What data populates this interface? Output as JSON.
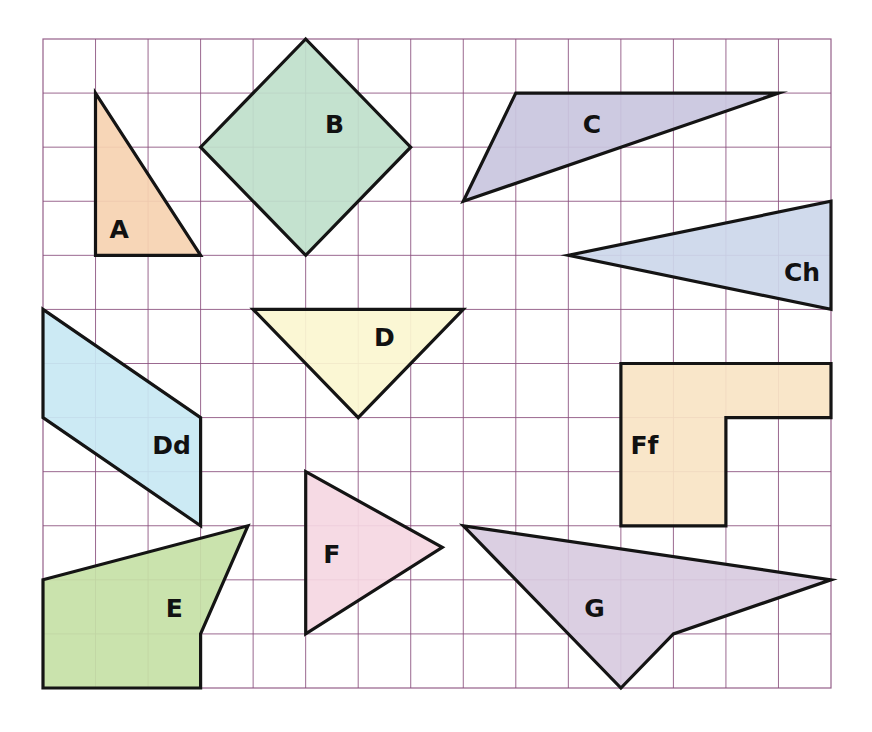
{
  "figure": {
    "width": 872,
    "height": 732,
    "grid": {
      "left": 43,
      "top": 39,
      "right": 831,
      "bottom": 688,
      "columns": 15,
      "rows": 12,
      "line_color": "#8a4f7d"
    },
    "outline_color": "#141414",
    "shapes": [
      {
        "id": "A",
        "label": "A",
        "fill": "#f6d2b1",
        "points": [
          [
            1,
            1
          ],
          [
            1,
            4
          ],
          [
            3,
            4
          ]
        ],
        "label_pos": [
          1.45,
          3.55
        ]
      },
      {
        "id": "B",
        "label": "B",
        "fill": "#bfe0cb",
        "points": [
          [
            5,
            0
          ],
          [
            7,
            2
          ],
          [
            5,
            4
          ],
          [
            3,
            2
          ]
        ],
        "label_pos": [
          5.55,
          1.6
        ]
      },
      {
        "id": "C",
        "label": "C",
        "fill": "#c9c6de",
        "points": [
          [
            8,
            3
          ],
          [
            9,
            1
          ],
          [
            14,
            1
          ]
        ],
        "label_pos": [
          10.45,
          1.6
        ]
      },
      {
        "id": "Ch",
        "label": "Ch",
        "fill": "#ccd7ea",
        "points": [
          [
            10,
            4
          ],
          [
            15,
            3
          ],
          [
            15,
            5
          ]
        ],
        "label_pos": [
          14.45,
          4.35
        ]
      },
      {
        "id": "D",
        "label": "D",
        "fill": "#fbf6d0",
        "points": [
          [
            4,
            5
          ],
          [
            8,
            5
          ],
          [
            6,
            7
          ]
        ],
        "label_pos": [
          6.5,
          5.55
        ]
      },
      {
        "id": "Dd",
        "label": "Dd",
        "fill": "#c8e8f3",
        "points": [
          [
            0,
            5
          ],
          [
            3,
            7
          ],
          [
            3,
            9
          ],
          [
            0,
            7
          ]
        ],
        "label_pos": [
          2.45,
          7.55
        ]
      },
      {
        "id": "Ff",
        "label": "Ff",
        "fill": "#f9e4c4",
        "points": [
          [
            11,
            6
          ],
          [
            15,
            6
          ],
          [
            15,
            7
          ],
          [
            13,
            7
          ],
          [
            13,
            9
          ],
          [
            11,
            9
          ]
        ],
        "label_pos": [
          11.45,
          7.55
        ]
      },
      {
        "id": "E",
        "label": "E",
        "fill": "#c6e1a6",
        "points": [
          [
            0,
            10
          ],
          [
            3.9,
            9
          ],
          [
            3,
            11
          ],
          [
            3,
            12
          ],
          [
            0,
            12
          ]
        ],
        "label_pos": [
          2.5,
          10.55
        ]
      },
      {
        "id": "F",
        "label": "F",
        "fill": "#f5d7e2",
        "points": [
          [
            5,
            8
          ],
          [
            7.6,
            9.4
          ],
          [
            5,
            11
          ]
        ],
        "label_pos": [
          5.5,
          9.55
        ]
      },
      {
        "id": "G",
        "label": "G",
        "fill": "#d8cbdf",
        "points": [
          [
            8,
            9
          ],
          [
            15,
            10
          ],
          [
            12,
            11
          ],
          [
            11,
            12
          ]
        ],
        "label_pos": [
          10.5,
          10.55
        ]
      }
    ]
  }
}
